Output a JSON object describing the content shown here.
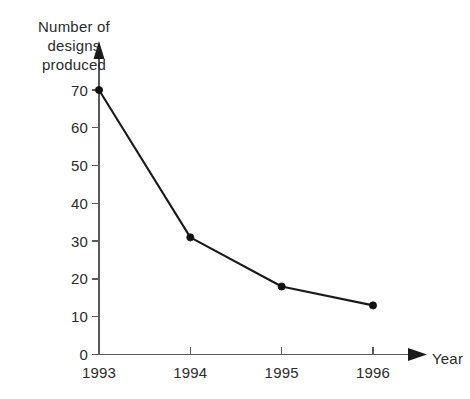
{
  "chart_data": {
    "type": "line",
    "title": "",
    "subtitle": "",
    "xlabel": "Year",
    "ylabel": "Number of designs produced",
    "ylabel_lines": [
      "Number of",
      "designs",
      "produced"
    ],
    "categories": [
      "1993",
      "1994",
      "1995",
      "1996"
    ],
    "x": [
      1993,
      1994,
      1995,
      1996
    ],
    "values": [
      70,
      31,
      18,
      13
    ],
    "series": [
      {
        "name": "Designs produced",
        "values": [
          70,
          31,
          18,
          13
        ]
      }
    ],
    "ylim": [
      0,
      70
    ],
    "y_ticks": [
      0,
      10,
      20,
      30,
      40,
      50,
      60,
      70
    ],
    "y_tick_labels": [
      "0",
      "10",
      "20",
      "30",
      "40",
      "50",
      "60",
      "70"
    ],
    "x_tick_labels": [
      "1993",
      "1994",
      "1995",
      "1996"
    ],
    "grid": false,
    "legend": false,
    "legend_position": "none",
    "marker": "filled-circle",
    "axis_arrows": [
      "y-up",
      "x-right"
    ],
    "colors": {
      "background": "#ffffff",
      "line": "#1a1a1a",
      "marker": "#111111",
      "axis": "#5a5a5a",
      "text": "#2b2b2b"
    }
  },
  "axis_labels": {
    "y_line_1": "Number of",
    "y_line_2": "designs",
    "y_line_3": "produced",
    "x_title": "Year"
  },
  "y_ticks": {
    "t0": "0",
    "t1": "10",
    "t2": "20",
    "t3": "30",
    "t4": "40",
    "t5": "50",
    "t6": "60",
    "t7": "70"
  },
  "x_ticks": {
    "t0": "1993",
    "t1": "1994",
    "t2": "1995",
    "t3": "1996"
  }
}
